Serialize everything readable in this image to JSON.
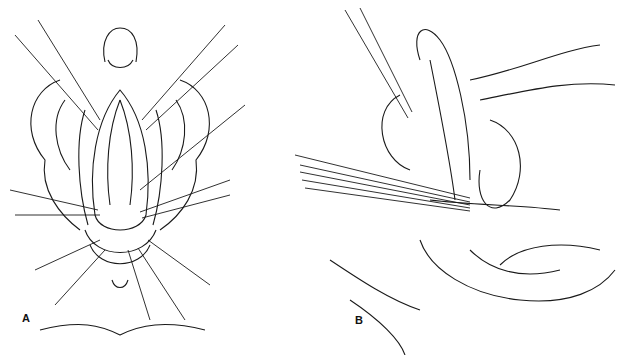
{
  "figure": {
    "panels": [
      {
        "label": "A",
        "description": "Anterior view illustration with retraction sutures"
      },
      {
        "label": "B",
        "description": "Sagittal section illustration with sutures"
      }
    ]
  }
}
